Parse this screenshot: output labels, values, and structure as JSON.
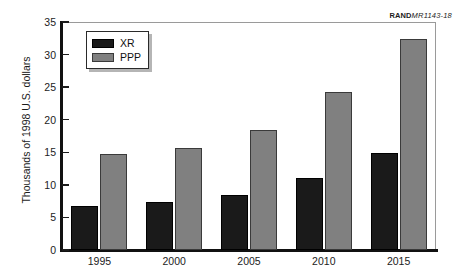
{
  "source_tag": {
    "org": "RAND",
    "code": "MR1143-18"
  },
  "legend": {
    "position": "top-left-inside",
    "items": [
      {
        "label": "XR",
        "color": "#1a1a1a"
      },
      {
        "label": "PPP",
        "color": "#808080"
      }
    ]
  },
  "chart_data": {
    "type": "bar",
    "title": "",
    "subtitle": "",
    "xlabel": "",
    "ylabel": "Thousands of 1998 U.S. dollars",
    "categories": [
      "1995",
      "2000",
      "2005",
      "2010",
      "2015"
    ],
    "series": [
      {
        "name": "XR",
        "color": "#1a1a1a",
        "values": [
          6.8,
          7.3,
          8.4,
          11.0,
          14.9
        ]
      },
      {
        "name": "PPP",
        "color": "#808080",
        "values": [
          14.7,
          15.7,
          18.5,
          24.3,
          32.4
        ]
      }
    ],
    "ylim": [
      0,
      35
    ],
    "yticks": [
      0,
      5,
      10,
      15,
      20,
      25,
      30,
      35
    ],
    "ytick_labels": [
      "0",
      "5",
      "10",
      "15",
      "20",
      "25",
      "30",
      "35"
    ],
    "grid": false,
    "legend_position": "upper left",
    "annotations": [
      "RAND MR1143-18"
    ]
  }
}
